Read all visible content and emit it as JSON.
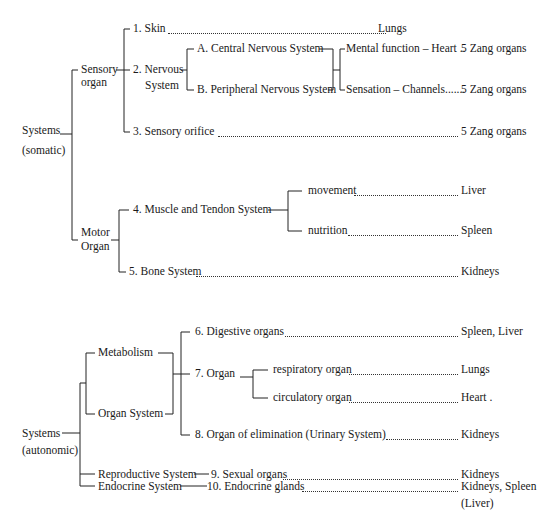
{
  "diagram": {
    "somatic": {
      "root": {
        "line1": "Systems",
        "line2": "(somatic)"
      },
      "sensory_organ": {
        "line1": "Sensory",
        "line2": "organ"
      },
      "motor_organ": {
        "line1": "Motor",
        "line2": "Organ"
      },
      "items": {
        "skin": {
          "label": "1. Skin",
          "organ": "Lungs"
        },
        "nervous": {
          "line1": "2. Nervous",
          "line2": "System"
        },
        "central": {
          "label": "A. Central Nervous System"
        },
        "peripheral": {
          "label": "B. Peripheral Nervous System"
        },
        "mental": {
          "label": "Mental function – Heart ..",
          "organ": "5 Zang organs"
        },
        "sensation": {
          "label": "Sensation – Channels.......",
          "organ": "5 Zang organs"
        },
        "orifice": {
          "label": "3. Sensory orifice",
          "organ": "5 Zang organs"
        },
        "muscle": {
          "label": "4. Muscle and Tendon System"
        },
        "movement": {
          "label": "movement",
          "organ": "Liver"
        },
        "nutrition": {
          "label": "nutrition",
          "organ": "Spleen"
        },
        "bone": {
          "label": "5. Bone System",
          "organ": "Kidneys"
        }
      }
    },
    "autonomic": {
      "root": {
        "line1": "Systems",
        "line2": "(autonomic)"
      },
      "metabolism": {
        "label": "Metabolism"
      },
      "organ_system": {
        "label": "Organ System"
      },
      "reproductive": {
        "label": "Reproductive System"
      },
      "endocrine": {
        "label": "Endocrine System"
      },
      "items": {
        "digestive": {
          "label": "6. Digestive organs",
          "organ": "Spleen, Liver"
        },
        "organ7": {
          "label": "7. Organ"
        },
        "respiratory": {
          "label": "respiratory organ",
          "organ": "Lungs"
        },
        "circulatory": {
          "label": "circulatory organ",
          "organ": "Heart ."
        },
        "elimination": {
          "label": "8. Organ of elimination (Urinary System)",
          "organ": "Kidneys"
        },
        "sexual": {
          "label": "9. Sexual organs",
          "organ": "Kidneys"
        },
        "endocrine_glands": {
          "label": "10. Endocrine glands",
          "organ": "Kidneys, Spleen",
          "organ_line2": "(Liver)"
        }
      }
    }
  }
}
